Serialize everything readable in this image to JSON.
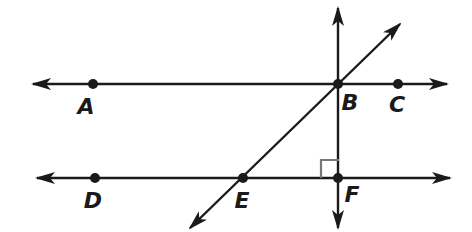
{
  "diagram": {
    "colors": {
      "line": "#1a1a1a",
      "right_angle_mark": "#777777",
      "background": "#ffffff"
    },
    "points": [
      {
        "name": "A",
        "label": "A",
        "x": 93,
        "y": 84,
        "lx": 86,
        "ly": 114
      },
      {
        "name": "B",
        "label": "B",
        "x": 338,
        "y": 84,
        "lx": 350,
        "ly": 110
      },
      {
        "name": "C",
        "label": "C",
        "x": 398,
        "y": 84,
        "lx": 397,
        "ly": 112
      },
      {
        "name": "D",
        "label": "D",
        "x": 95,
        "y": 178,
        "lx": 93,
        "ly": 208
      },
      {
        "name": "E",
        "label": "E",
        "x": 243,
        "y": 178,
        "lx": 242,
        "ly": 208
      },
      {
        "name": "F",
        "label": "F",
        "x": 338,
        "y": 178,
        "lx": 352,
        "ly": 202
      }
    ],
    "lines": [
      {
        "name": "line-ABC",
        "x1": 33,
        "y1": 84,
        "x2": 447,
        "y2": 84
      },
      {
        "name": "line-DEF",
        "x1": 37,
        "y1": 178,
        "x2": 450,
        "y2": 178
      },
      {
        "name": "line-BF-vertical",
        "x1": 338,
        "y1": 8,
        "x2": 338,
        "y2": 228
      },
      {
        "name": "line-EB-transversal",
        "x1": 190,
        "y1": 228,
        "x2": 400,
        "y2": 24
      }
    ],
    "right_angle": {
      "at": "F",
      "x": 321,
      "y": 160,
      "size": 18
    }
  }
}
